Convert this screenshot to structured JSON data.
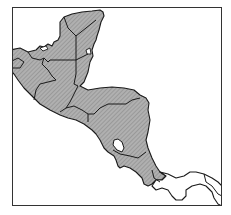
{
  "map": {
    "type": "distribution-range-map",
    "region": "Central America",
    "frame": {
      "x": 12,
      "y": 7,
      "width": 210,
      "height": 199
    },
    "colors": {
      "background": "#ffffff",
      "range_fill": "#a9a9a9",
      "hatch": "#8a8a8a",
      "border": "#1a1a1a",
      "unshaded_land": "#ffffff"
    },
    "shaded_regions": [
      "southern-mexico",
      "yucatan",
      "guatemala",
      "belize",
      "el-salvador",
      "honduras",
      "nicaragua",
      "costa-rica",
      "western-panama"
    ],
    "unshaded_regions": [
      "central-eastern-panama",
      "lake-nicaragua"
    ]
  }
}
